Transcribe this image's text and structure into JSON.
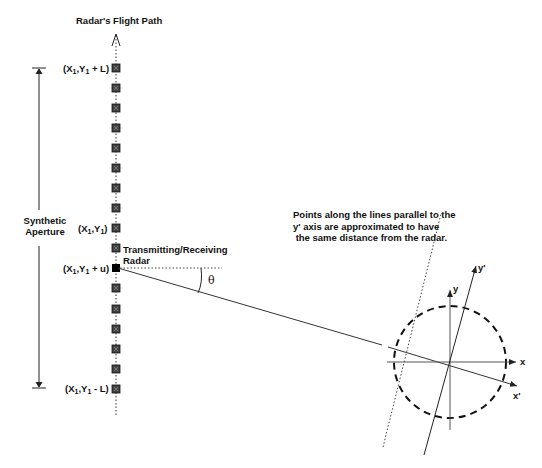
{
  "title": "Radar's Flight Path",
  "aperture_label": [
    "Synthetic",
    "Aperture"
  ],
  "radar_label": [
    "Transmitting/Receiving",
    "Radar"
  ],
  "angle_label": "θ",
  "note": "Points along the lines parallel to the\ny' axis are approximated to have\n the same distance from the radar.",
  "position_labels": {
    "top": {
      "pre": "(X",
      "s1": "1",
      "mid": ",Y",
      "s2": "1",
      "post": " + L)"
    },
    "center": {
      "pre": "(X",
      "s1": "1",
      "mid": ",Y",
      "s2": "1",
      "post": ")"
    },
    "radar": {
      "pre": "(X",
      "s1": "1",
      "mid": ",Y",
      "s2": "1",
      "post": " + u)"
    },
    "bottom": {
      "pre": "(X",
      "s1": "1",
      "mid": ",Y",
      "s2": "1",
      "post": " - L)"
    }
  },
  "axis_labels": {
    "x": "x",
    "y": "y",
    "x_prime": "x'",
    "y_prime": "y'"
  },
  "geometry": {
    "path_x": 116,
    "element_ys": [
      68,
      88,
      108,
      128,
      148,
      168,
      188,
      208,
      228,
      248,
      288,
      309,
      329,
      349,
      369,
      389
    ],
    "radar_y": 268,
    "target_center": [
      450,
      362
    ],
    "target_radius": 56
  }
}
